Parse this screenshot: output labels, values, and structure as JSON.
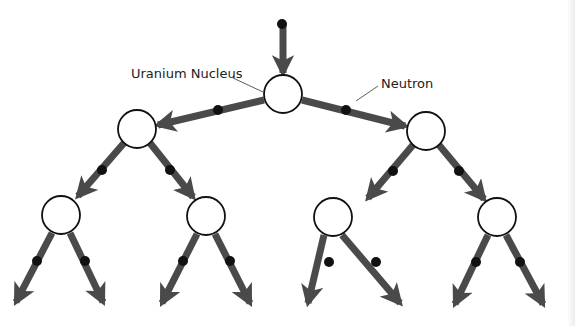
{
  "labels": {
    "uranium": "Uranium Nucleus",
    "neutron": "Neutron"
  },
  "colors": {
    "arrow": "#4a4a4a",
    "neutron": "#111111",
    "nucleus_fill": "#ffffff",
    "nucleus_stroke": "#111111"
  },
  "nodes": [
    {
      "id": "n0",
      "x": 283,
      "y": 94,
      "r": 19
    },
    {
      "id": "n1",
      "x": 137,
      "y": 129,
      "r": 19
    },
    {
      "id": "n2",
      "x": 426,
      "y": 131,
      "r": 19
    },
    {
      "id": "n3",
      "x": 61,
      "y": 215,
      "r": 19
    },
    {
      "id": "n4",
      "x": 206,
      "y": 216,
      "r": 19
    },
    {
      "id": "n5",
      "x": 333,
      "y": 217,
      "r": 19
    },
    {
      "id": "n6",
      "x": 497,
      "y": 217,
      "r": 19
    }
  ],
  "arrows": [
    {
      "x1": 283,
      "y1": 24,
      "x2": 283,
      "y2": 73,
      "dot": [
        282,
        24
      ]
    },
    {
      "x1": 264,
      "y1": 100,
      "x2": 158,
      "y2": 125,
      "dot": [
        218,
        110
      ]
    },
    {
      "x1": 302,
      "y1": 100,
      "x2": 405,
      "y2": 126,
      "dot": [
        346,
        110
      ]
    },
    {
      "x1": 124,
      "y1": 143,
      "x2": 78,
      "y2": 196,
      "dot": [
        102,
        170
      ]
    },
    {
      "x1": 150,
      "y1": 143,
      "x2": 193,
      "y2": 197,
      "dot": [
        170,
        170
      ]
    },
    {
      "x1": 413,
      "y1": 145,
      "x2": 368,
      "y2": 198,
      "dot": [
        393,
        171
      ]
    },
    {
      "x1": 439,
      "y1": 145,
      "x2": 484,
      "y2": 199,
      "dot": [
        459,
        171
      ]
    },
    {
      "x1": 52,
      "y1": 233,
      "x2": 16,
      "y2": 302,
      "dot": [
        37,
        261
      ]
    },
    {
      "x1": 70,
      "y1": 233,
      "x2": 103,
      "y2": 302,
      "dot": [
        85,
        261
      ]
    },
    {
      "x1": 197,
      "y1": 234,
      "x2": 162,
      "y2": 303,
      "dot": [
        183,
        261
      ]
    },
    {
      "x1": 215,
      "y1": 234,
      "x2": 250,
      "y2": 303,
      "dot": [
        230,
        261
      ]
    },
    {
      "x1": 324,
      "y1": 235,
      "x2": 308,
      "y2": 303,
      "dot": [
        329,
        262
      ]
    },
    {
      "x1": 342,
      "y1": 235,
      "x2": 400,
      "y2": 303,
      "dot": [
        376,
        262
      ]
    },
    {
      "x1": 488,
      "y1": 235,
      "x2": 455,
      "y2": 304,
      "dot": [
        476,
        262
      ]
    },
    {
      "x1": 506,
      "y1": 235,
      "x2": 543,
      "y2": 304,
      "dot": [
        520,
        262
      ]
    }
  ],
  "leaders": [
    {
      "x1": 233,
      "y1": 78,
      "x2": 263,
      "y2": 92
    },
    {
      "x1": 378,
      "y1": 86,
      "x2": 356,
      "y2": 101
    }
  ]
}
